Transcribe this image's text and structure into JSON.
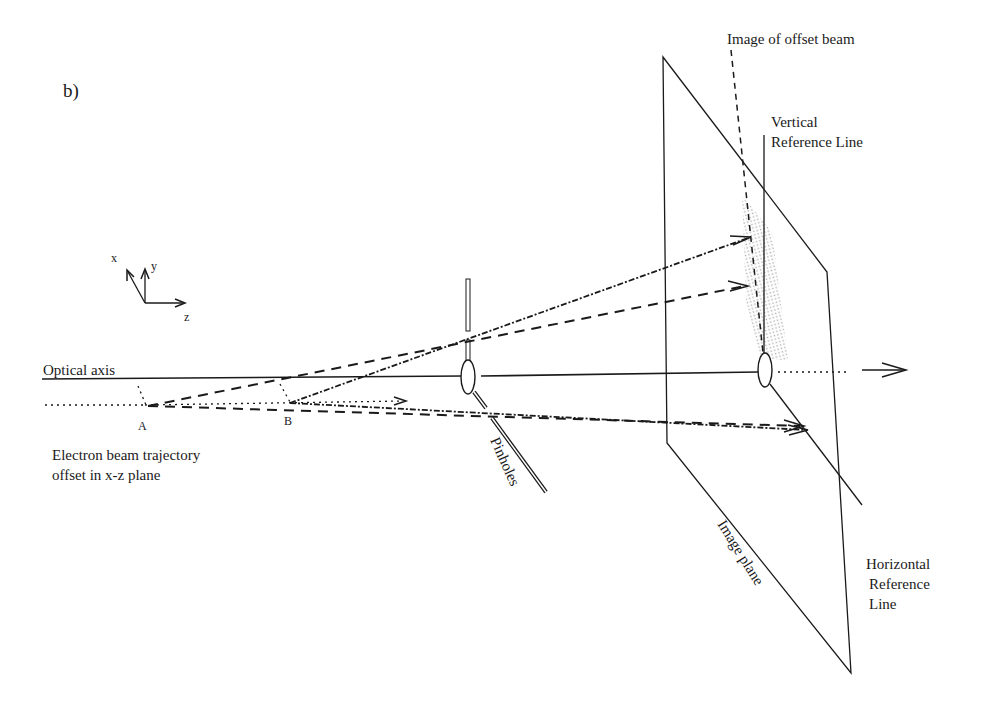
{
  "panel_label": "b)",
  "axes_glyph": {
    "x_label": "x",
    "y_label": "y",
    "z_label": "z"
  },
  "labels": {
    "optical_axis": "Optical axis",
    "point_a": "A",
    "point_b": "B",
    "trajectory_line1": "Electron beam trajectory",
    "trajectory_line2": "offset in x-z plane",
    "pinholes": "Pinholes",
    "image_plane": "Image plane",
    "image_of_offset_beam": "Image of offset beam",
    "vertical_ref_line1": "Vertical",
    "vertical_ref_line2": "Reference Line",
    "horizontal_ref_line1": "Horizontal",
    "horizontal_ref_line2": "Reference",
    "horizontal_ref_line3": "Line"
  },
  "colors": {
    "ink": "#1a1a1a",
    "background": "#ffffff",
    "hatch": "#9a9a9a"
  }
}
